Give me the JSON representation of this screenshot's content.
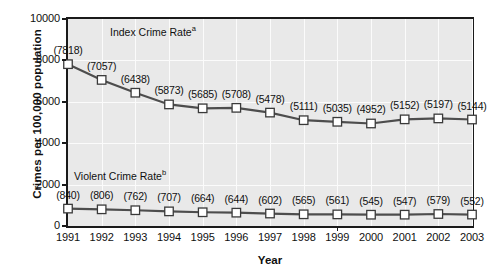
{
  "chart_data": {
    "type": "line",
    "title": "",
    "xlabel": "Year",
    "ylabel": "Crimes per 100,000 population",
    "categories": [
      "1991",
      "1992",
      "1993",
      "1994",
      "1995",
      "1996",
      "1997",
      "1998",
      "1999",
      "2000",
      "2001",
      "2002",
      "2003"
    ],
    "ylim": [
      0,
      10000
    ],
    "yticks": [
      "0",
      "2000",
      "4000",
      "6000",
      "8000",
      "10000"
    ],
    "ytick_values": [
      0,
      2000,
      4000,
      6000,
      8000,
      10000
    ],
    "grid": true,
    "legend": "in-plot annotations",
    "series": [
      {
        "name": "Index Crime Rate",
        "footnote": "a",
        "caption": "Index Crime Rate",
        "values": [
          7818,
          7057,
          6438,
          5873,
          5685,
          5708,
          5478,
          5111,
          5035,
          4952,
          5152,
          5197,
          5144
        ],
        "labels": [
          "(7818)",
          "(7057)",
          "(6438)",
          "(5873)",
          "(5685)",
          "(5708)",
          "(5478)",
          "(5111)",
          "(5035)",
          "(4952)",
          "(5152)",
          "(5197)",
          "(5144)"
        ]
      },
      {
        "name": "Violent Crime Rate",
        "footnote": "b",
        "caption": "Violent Crime Rate",
        "values": [
          840,
          806,
          762,
          707,
          664,
          644,
          602,
          565,
          561,
          545,
          547,
          579,
          552
        ],
        "labels": [
          "(840)",
          "(806)",
          "(762)",
          "(707)",
          "(664)",
          "(644)",
          "(602)",
          "(565)",
          "(561)",
          "(545)",
          "(547)",
          "(579)",
          "(552)"
        ]
      }
    ],
    "colors": {
      "plot_background": "#e9e9e9",
      "gridline": "#fbfbfb",
      "axis": "#1a1a1a",
      "line": "#4d4d4d",
      "marker_fill": "#ffffff",
      "marker_edge": "#3a3a3a",
      "text": "#101010"
    }
  }
}
